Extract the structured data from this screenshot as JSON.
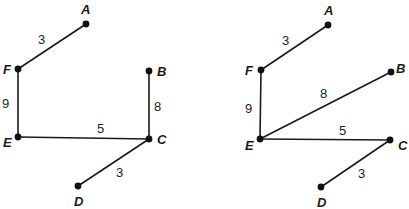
{
  "graphs": [
    {
      "id": "left-graph",
      "nodes": [
        {
          "id": "A",
          "label": "A",
          "x": 86,
          "y": 24,
          "lx": 81,
          "ly": 14
        },
        {
          "id": "F",
          "label": "F",
          "x": 18,
          "y": 69,
          "lx": 3,
          "ly": 74
        },
        {
          "id": "B",
          "label": "B",
          "x": 149,
          "y": 71,
          "lx": 157,
          "ly": 76
        },
        {
          "id": "E",
          "label": "E",
          "x": 18,
          "y": 137,
          "lx": 3,
          "ly": 147
        },
        {
          "id": "C",
          "label": "C",
          "x": 149,
          "y": 139,
          "lx": 157,
          "ly": 144
        },
        {
          "id": "D",
          "label": "D",
          "x": 78,
          "y": 186,
          "lx": 74,
          "ly": 206
        }
      ],
      "edges": [
        {
          "from": "F",
          "to": "A",
          "weight": "3",
          "wx": 38,
          "wy": 44
        },
        {
          "from": "F",
          "to": "E",
          "weight": "9",
          "wx": 2,
          "wy": 108
        },
        {
          "from": "B",
          "to": "C",
          "weight": "8",
          "wx": 154,
          "wy": 111
        },
        {
          "from": "E",
          "to": "C",
          "weight": "5",
          "wx": 97,
          "wy": 133
        },
        {
          "from": "C",
          "to": "D",
          "weight": "3",
          "wx": 116,
          "wy": 177
        }
      ]
    },
    {
      "id": "right-graph",
      "nodes": [
        {
          "id": "A",
          "label": "A",
          "x": 328,
          "y": 25,
          "lx": 324,
          "ly": 15
        },
        {
          "id": "F",
          "label": "F",
          "x": 261,
          "y": 70,
          "lx": 245,
          "ly": 75
        },
        {
          "id": "B",
          "label": "B",
          "x": 391,
          "y": 72,
          "lx": 396,
          "ly": 73
        },
        {
          "id": "E",
          "label": "E",
          "x": 260,
          "y": 139,
          "lx": 245,
          "ly": 150
        },
        {
          "id": "C",
          "label": "C",
          "x": 390,
          "y": 140,
          "lx": 398,
          "ly": 150
        },
        {
          "id": "D",
          "label": "D",
          "x": 321,
          "y": 187,
          "lx": 317,
          "ly": 207
        }
      ],
      "edges": [
        {
          "from": "F",
          "to": "A",
          "weight": "3",
          "wx": 282,
          "wy": 45
        },
        {
          "from": "F",
          "to": "E",
          "weight": "9",
          "wx": 245,
          "wy": 113
        },
        {
          "from": "E",
          "to": "B",
          "weight": "8",
          "wx": 320,
          "wy": 98
        },
        {
          "from": "E",
          "to": "C",
          "weight": "5",
          "wx": 339,
          "wy": 135
        },
        {
          "from": "C",
          "to": "D",
          "weight": "3",
          "wx": 358,
          "wy": 178
        }
      ]
    }
  ]
}
